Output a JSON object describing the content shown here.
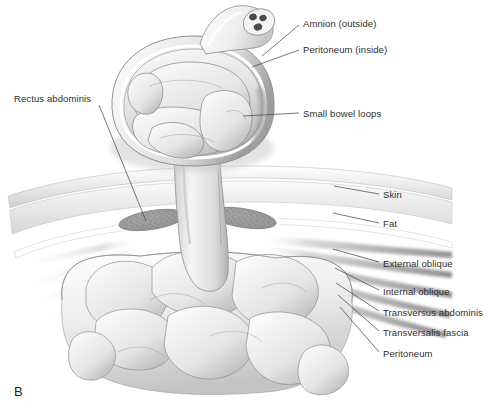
{
  "figure": {
    "panel_label": "B",
    "style": "grayscale-medical-illustration",
    "colors": {
      "background": "#ffffff",
      "text": "#2e2e2e",
      "leader_line": "#4a4a4a",
      "tissue_light": "#f2f2f2",
      "tissue_mid": "#d8d8d8",
      "tissue_shadow": "#9e9e9e",
      "muscle_stipple": "#9a9a9a",
      "outline": "#6e6e6e"
    }
  },
  "labels": [
    {
      "id": "amnion",
      "text": "Amnion (outside)",
      "x": 303,
      "y": 18,
      "leader": [
        [
          299,
          25
        ],
        [
          262,
          56
        ]
      ]
    },
    {
      "id": "peritoneum_inside",
      "text": "Peritoneum (inside)",
      "x": 303,
      "y": 44,
      "leader": [
        [
          299,
          50
        ],
        [
          252,
          67
        ]
      ]
    },
    {
      "id": "small_bowel_loops",
      "text": "Small bowel loops",
      "x": 303,
      "y": 108,
      "leader": [
        [
          299,
          113
        ],
        [
          243,
          116
        ]
      ]
    },
    {
      "id": "rectus_abdominis",
      "text": "Rectus abdominis",
      "x": 14,
      "y": 93,
      "leader": [
        [
          99,
          105
        ],
        [
          146,
          221
        ]
      ]
    },
    {
      "id": "skin",
      "text": "Skin",
      "x": 383,
      "y": 189,
      "leader": [
        [
          379,
          194
        ],
        [
          334,
          186
        ]
      ]
    },
    {
      "id": "fat",
      "text": "Fat",
      "x": 383,
      "y": 218,
      "leader": [
        [
          379,
          223
        ],
        [
          333,
          213
        ]
      ]
    },
    {
      "id": "external_oblique",
      "text": "External oblique",
      "x": 383,
      "y": 258,
      "leader": [
        [
          379,
          262
        ],
        [
          333,
          249
        ]
      ]
    },
    {
      "id": "internal_oblique",
      "text": "Internal oblique",
      "x": 383,
      "y": 286,
      "leader": [
        [
          379,
          290
        ],
        [
          335,
          268
        ]
      ]
    },
    {
      "id": "transversus_abdominis",
      "text": "Transversus abdominis",
      "x": 383,
      "y": 307,
      "leader": [
        [
          379,
          311
        ],
        [
          336,
          283
        ]
      ]
    },
    {
      "id": "transversalis_fascia",
      "text": "Transversalis fascia",
      "x": 383,
      "y": 327,
      "leader": [
        [
          379,
          331
        ],
        [
          338,
          295
        ]
      ]
    },
    {
      "id": "peritoneum_wall",
      "text": "Peritoneum",
      "x": 383,
      "y": 348,
      "leader": [
        [
          379,
          352
        ],
        [
          340,
          307
        ]
      ]
    }
  ]
}
